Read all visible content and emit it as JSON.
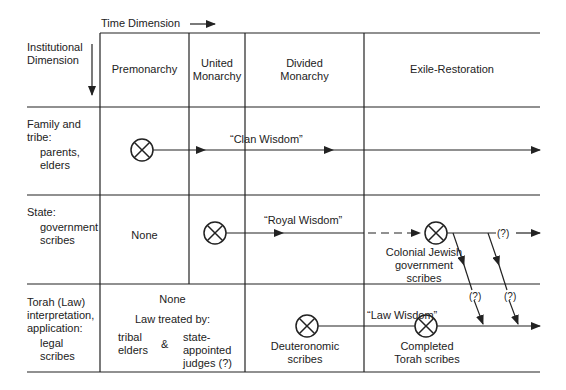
{
  "header": {
    "time_dimension": "Time Dimension",
    "institutional_dimension": [
      "Institutional",
      "Dimension"
    ]
  },
  "periods": [
    {
      "label": [
        "Premonarchy"
      ]
    },
    {
      "label": [
        "United",
        "Monarchy"
      ]
    },
    {
      "label": [
        "Divided",
        "Monarchy"
      ]
    },
    {
      "label": [
        "Exile-Restoration"
      ]
    }
  ],
  "rows": [
    {
      "heading": [
        "Family and",
        "tribe:"
      ],
      "sub": [
        "parents,",
        "elders"
      ],
      "stream_label": "“Clan Wisdom”"
    },
    {
      "heading": [
        "State:"
      ],
      "sub": [
        "government",
        "scribes"
      ],
      "premonarchy_text": "None",
      "stream_label": "“Royal Wisdom”",
      "node_label": [
        "Colonial Jewish",
        "government",
        "scribes"
      ],
      "uncertain_marker": "(?)"
    },
    {
      "heading": [
        "Torah (Law)",
        "interpretation,",
        "application:"
      ],
      "sub": [
        "legal",
        "scribes"
      ],
      "premonarchy_text": "None",
      "law_treated_by": "Law treated by:",
      "tribal": [
        "tribal",
        "elders"
      ],
      "ampersand": "&",
      "judges": [
        "state-",
        "appointed",
        "judges (?)"
      ],
      "deut_label": [
        "Deuteronomic",
        "scribes"
      ],
      "stream_label": "“Law Wisdom”",
      "torah_label": [
        "Completed",
        "Torah scribes"
      ],
      "uncertain_markers": [
        "(?)",
        "(?)"
      ]
    }
  ],
  "colors": {
    "ink": "#222222",
    "paper": "#ffffff"
  }
}
